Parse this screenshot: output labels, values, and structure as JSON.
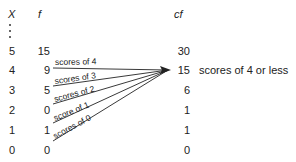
{
  "headers": {
    "x": "X",
    "f": "f",
    "cf": "cf"
  },
  "ellipsis": "⋮",
  "rows": [
    {
      "x": "5",
      "f": "15",
      "cf": "30"
    },
    {
      "x": "4",
      "f": "9",
      "cf": "15"
    },
    {
      "x": "3",
      "f": "5",
      "cf": "6"
    },
    {
      "x": "2",
      "f": "0",
      "cf": "1"
    },
    {
      "x": "1",
      "f": "1",
      "cf": "1"
    },
    {
      "x": "0",
      "f": "0",
      "cf": "0"
    }
  ],
  "arrow_labels": [
    "scores of 4",
    "scores of 3",
    "scores of 2",
    "score   of 1",
    "scores of 0"
  ],
  "annotation": "scores of 4 or less"
}
